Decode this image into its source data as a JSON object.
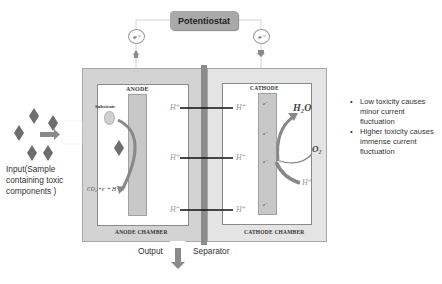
{
  "potentiostat": {
    "label": "Potentiostat"
  },
  "electron_circles": {
    "left": "e⁻",
    "right": "e⁻"
  },
  "anode": {
    "electrode_label": "ANODE",
    "chamber_label": "ANODE CHAMBER",
    "substrate_label": "Substrate",
    "reaction": "CO₂ +e⁻+ H⁺"
  },
  "cathode": {
    "electrode_label": "CATHODE",
    "chamber_label": "CATHODE CHAMBER",
    "electrons": [
      "e⁻",
      "e⁻",
      "e⁻",
      "e⁻"
    ],
    "product": "H₂O",
    "oxygen": "O₂",
    "proton": "H⁺"
  },
  "proton_transfer": [
    {
      "left": "H⁺",
      "right": "H⁺"
    },
    {
      "left": "H⁺",
      "right": "H⁺"
    },
    {
      "left": "H⁺",
      "right": "H⁺"
    }
  ],
  "input": {
    "label_lines": [
      "Input(Sample",
      "containing toxic",
      "components )"
    ]
  },
  "output": {
    "label": "Output"
  },
  "separator": {
    "label": "Separator"
  },
  "notes": [
    {
      "lines": [
        "Low toxicity causes",
        "minor current",
        "fluctuation"
      ]
    },
    {
      "lines": [
        "Higher toxicity causes",
        "immense current",
        "fluctuation"
      ]
    }
  ],
  "colors": {
    "chamber_fill": "#d3d3d3",
    "electrode_fill": "#c8c8c8",
    "separator": "#8c8c8c",
    "diamond": "#6e6e6e",
    "arrow": "#8a8a8a",
    "potentiostat": "#a9a9a9"
  }
}
